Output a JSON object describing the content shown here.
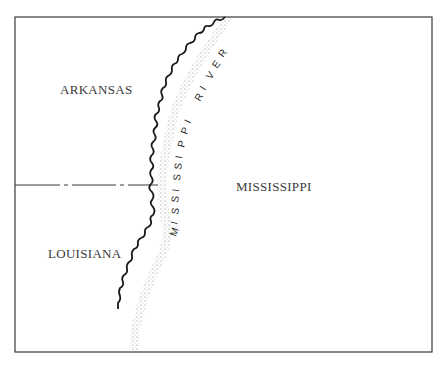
{
  "map": {
    "states": [
      {
        "name": "ARKANSAS",
        "x": 60,
        "y": 81
      },
      {
        "name": "MISSISSIPPI",
        "x": 236,
        "y": 178
      },
      {
        "name": "LOUISIANA",
        "x": 48,
        "y": 246
      }
    ],
    "river": {
      "name": "MISSISSIPPI RIVER",
      "letters": [
        "M",
        "I",
        "S",
        "S",
        "I",
        "S",
        "S",
        "I",
        "P",
        "P",
        "I",
        " ",
        "R",
        "I",
        "V",
        "E",
        "R"
      ]
    },
    "colors": {
      "frame": "#3a3a3a",
      "river_bank": "#1a1a1a",
      "stipple": "#777777",
      "text": "#3a3a3a"
    }
  }
}
